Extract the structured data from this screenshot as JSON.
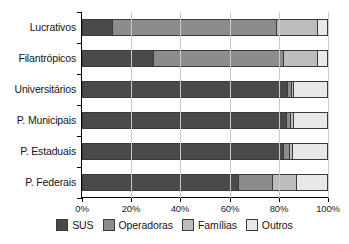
{
  "chart_data": {
    "type": "bar",
    "orientation": "horizontal",
    "stacked": true,
    "normalized": true,
    "title": "",
    "subtitle": "",
    "xlabel": "",
    "ylabel": "",
    "xlim": [
      0,
      100
    ],
    "grid": true,
    "legend_position": "bottom",
    "xtick_labels": [
      "0%",
      "20%",
      "40%",
      "60%",
      "80%",
      "100%"
    ],
    "xtick_values": [
      0,
      20,
      40,
      60,
      80,
      100
    ],
    "categories": [
      "Lucrativos",
      "Filantrópicos",
      "Universitários",
      "P. Municipais",
      "P. Estaduais",
      "P. Federais"
    ],
    "series": [
      {
        "name": "SUS",
        "color": "#4a4a4a",
        "values": [
          12.2,
          28.9,
          83.3,
          83.0,
          81.7,
          63.4
        ]
      },
      {
        "name": "Operadoras",
        "color": "#8c8c8c",
        "values": [
          66.7,
          52.8,
          1.6,
          1.6,
          2.4,
          13.8
        ]
      },
      {
        "name": "Famílias",
        "color": "#bdbdbd",
        "values": [
          16.7,
          13.8,
          0.8,
          1.2,
          1.2,
          9.8
        ]
      },
      {
        "name": "Outros",
        "color": "#e8e8e8",
        "values": [
          4.4,
          4.5,
          14.3,
          14.2,
          14.7,
          13.0
        ]
      }
    ]
  },
  "legend": {
    "items": [
      {
        "label": "SUS",
        "color": "#4a4a4a"
      },
      {
        "label": "Operadoras",
        "color": "#8c8c8c"
      },
      {
        "label": "Famílias",
        "color": "#bdbdbd"
      },
      {
        "label": "Outros",
        "color": "#e8e8e8"
      }
    ]
  },
  "colors": {
    "axis": "#000000",
    "grid": "#c9c9c9",
    "text": "#151515",
    "segment_border": "#3a3a3a",
    "background": "#ffffff"
  }
}
